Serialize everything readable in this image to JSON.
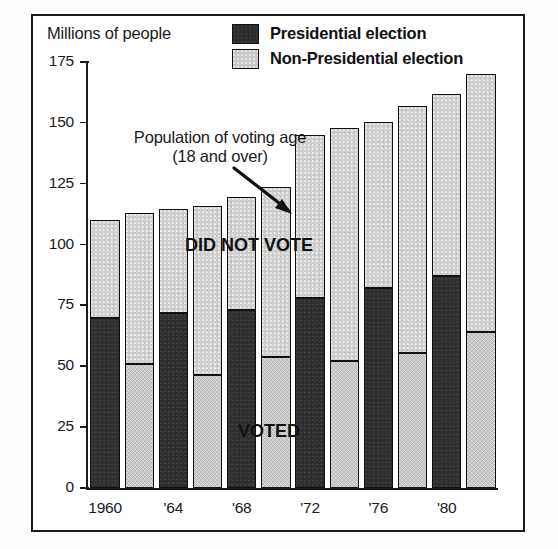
{
  "axis_title": "Millions of people",
  "legend": {
    "items": [
      {
        "label": "Presidential election",
        "swatch": "dark-swatch",
        "color": "#2b2b2b"
      },
      {
        "label": "Non-Presidential election",
        "swatch": "light-swatch",
        "color": "#c9c9c9"
      }
    ]
  },
  "annotations": {
    "population_line1": "Population of voting age",
    "population_line2": "(18 and over)",
    "did_not_vote": "DID NOT VOTE",
    "voted": "VOTED"
  },
  "chart_data": {
    "type": "bar",
    "title": "",
    "subtitle": "",
    "xlabel": "",
    "ylabel": "Millions of people",
    "ylim": [
      0,
      175
    ],
    "yticks": [
      0,
      25,
      50,
      75,
      100,
      125,
      150,
      175
    ],
    "ytick_labels": [
      "0",
      "25",
      "50",
      "75",
      "100",
      "125",
      "150",
      "175"
    ],
    "xtick_labels": [
      "1960",
      "'64",
      "'68",
      "'72",
      "'76",
      "'80"
    ],
    "xtick_bar_index": [
      0,
      2,
      4,
      6,
      8,
      10
    ],
    "grid": false,
    "legend_position": "top-right",
    "stacked": true,
    "bar_count": 12,
    "bars": [
      {
        "index": 0,
        "x_label": "1960",
        "election_type": "Presidential",
        "voted": 70,
        "total": 110
      },
      {
        "index": 1,
        "x_label": "",
        "election_type": "Non-Presidential",
        "voted": 51,
        "total": 113
      },
      {
        "index": 2,
        "x_label": "'64",
        "election_type": "Presidential",
        "voted": 72,
        "total": 114.5
      },
      {
        "index": 3,
        "x_label": "",
        "election_type": "Non-Presidential",
        "voted": 46.5,
        "total": 116
      },
      {
        "index": 4,
        "x_label": "'68",
        "election_type": "Presidential",
        "voted": 73,
        "total": 119.5
      },
      {
        "index": 5,
        "x_label": "",
        "election_type": "Non-Presidential",
        "voted": 54,
        "total": 123.5
      },
      {
        "index": 6,
        "x_label": "'72",
        "election_type": "Presidential",
        "voted": 78,
        "total": 145
      },
      {
        "index": 7,
        "x_label": "",
        "election_type": "Non-Presidential",
        "voted": 52,
        "total": 148
      },
      {
        "index": 8,
        "x_label": "'76",
        "election_type": "Presidential",
        "voted": 82,
        "total": 150.5
      },
      {
        "index": 9,
        "x_label": "",
        "election_type": "Non-Presidential",
        "voted": 55.5,
        "total": 157
      },
      {
        "index": 10,
        "x_label": "'80",
        "election_type": "Presidential",
        "voted": 87,
        "total": 162
      },
      {
        "index": 11,
        "x_label": "",
        "election_type": "Non-Presidential",
        "voted": 64,
        "total": 170
      }
    ],
    "series": [
      {
        "name": "VOTED",
        "values": [
          70,
          51,
          72,
          46.5,
          73,
          54,
          78,
          52,
          82,
          55.5,
          87,
          64
        ]
      },
      {
        "name": "DID NOT VOTE",
        "values": [
          40,
          62,
          42.5,
          69.5,
          46.5,
          69.5,
          67,
          96,
          68.5,
          101.5,
          75,
          106
        ]
      }
    ],
    "totals": [
      110,
      113,
      114.5,
      116,
      119.5,
      123.5,
      145,
      148,
      150.5,
      157,
      162,
      170
    ]
  }
}
